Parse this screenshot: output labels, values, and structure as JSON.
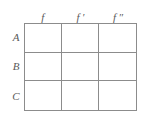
{
  "table": {
    "column_headers": [
      "f",
      "f ′",
      "f ″"
    ],
    "row_labels": [
      "A",
      "B",
      "C"
    ],
    "rows": [
      {
        "label": "A",
        "cells": [
          "",
          "",
          ""
        ]
      },
      {
        "label": "B",
        "cells": [
          "",
          "",
          ""
        ]
      },
      {
        "label": "C",
        "cells": [
          "",
          "",
          ""
        ]
      }
    ],
    "colors": {
      "border": "#8c8c8c",
      "text": "#5a5a5a",
      "background": "#ffffff"
    }
  }
}
